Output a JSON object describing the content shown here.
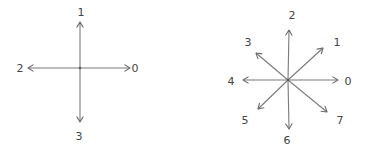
{
  "diagrams": [
    {
      "name": "4-direction chain code",
      "center": [
        80,
        68
      ],
      "directions": [
        {
          "code": "0",
          "tip": [
            130,
            68
          ],
          "label": [
            135,
            72
          ]
        },
        {
          "code": "1",
          "tip": [
            80,
            22
          ],
          "label": [
            81,
            16
          ]
        },
        {
          "code": "2",
          "tip": [
            28,
            68
          ],
          "label": [
            20,
            72
          ]
        },
        {
          "code": "3",
          "tip": [
            80,
            122
          ],
          "label": [
            79,
            140
          ]
        }
      ]
    },
    {
      "name": "8-direction chain code",
      "center": [
        288,
        80
      ],
      "directions": [
        {
          "code": "0",
          "tip": [
            338,
            80
          ],
          "label": [
            348,
            85
          ]
        },
        {
          "code": "1",
          "tip": [
            323,
            48
          ],
          "label": [
            337,
            46
          ]
        },
        {
          "code": "2",
          "tip": [
            289,
            30
          ],
          "label": [
            292,
            19
          ]
        },
        {
          "code": "3",
          "tip": [
            256,
            53
          ],
          "label": [
            248,
            46
          ]
        },
        {
          "code": "4",
          "tip": [
            243,
            80
          ],
          "label": [
            231,
            85
          ]
        },
        {
          "code": "5",
          "tip": [
            258,
            109
          ],
          "label": [
            245,
            124
          ]
        },
        {
          "code": "6",
          "tip": [
            289,
            129
          ],
          "label": [
            287,
            144
          ]
        },
        {
          "code": "7",
          "tip": [
            327,
            112
          ],
          "label": [
            340,
            124
          ]
        }
      ]
    }
  ]
}
